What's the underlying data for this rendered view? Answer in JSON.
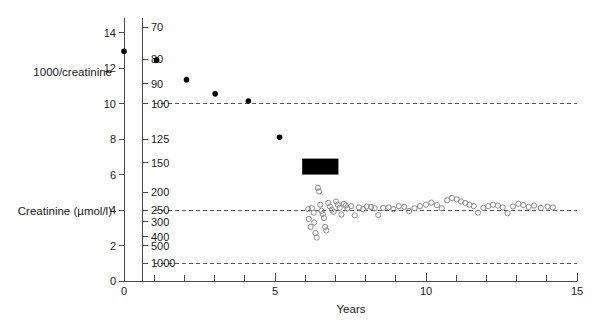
{
  "chart_data": {
    "type": "scatter",
    "title": "",
    "xlabel": "Years",
    "ylabel_primary": "1000/creatinine",
    "ylabel_secondary": "Creatinine (µmol/l)",
    "xlim": [
      0,
      15
    ],
    "ylim": [
      0,
      14.6
    ],
    "grid": false,
    "legend": "none",
    "x_ticks_major": [
      0,
      5,
      10,
      15
    ],
    "x_ticks_minor": [
      1,
      2,
      3,
      4,
      6,
      7,
      8,
      9,
      11,
      12,
      13,
      14
    ],
    "x_tick_labels": [
      "0",
      "5",
      "10",
      "15"
    ],
    "y_ticks_left": [
      0,
      2,
      4,
      6,
      8,
      10,
      12,
      14
    ],
    "y_tick_labels_left": [
      "0",
      "2",
      "4",
      "6",
      "8",
      "10",
      "12",
      "14"
    ],
    "y_ticks_right_values": [
      14.29,
      12.5,
      11.11,
      10.0,
      8.0,
      6.67,
      5.0,
      4.0,
      3.33,
      2.5,
      2.0,
      1.0
    ],
    "y_tick_labels_right": [
      "70",
      "80",
      "90",
      "100",
      "125",
      "150",
      "200",
      "250",
      "300",
      "400",
      "500",
      "1000"
    ],
    "reference_lines": [
      {
        "y": 10.0,
        "label": "100",
        "style": "dashed"
      },
      {
        "y": 4.0,
        "label": "250",
        "style": "dashed"
      },
      {
        "y": 1.0,
        "label": "1000",
        "style": "dashed"
      }
    ],
    "annotation_bar": {
      "name": "treatment-period-bar",
      "x_start": 5.9,
      "x_end": 7.1,
      "y_bottom": 6.0,
      "y_top": 6.9,
      "color": "#000000"
    },
    "series": [
      {
        "name": "pre-treatment",
        "marker": "filled-circle",
        "color": "#000000",
        "points": [
          [
            0.0,
            12.95
          ],
          [
            1.08,
            12.45
          ],
          [
            2.07,
            11.35
          ],
          [
            3.02,
            10.55
          ],
          [
            4.12,
            10.15
          ],
          [
            5.15,
            8.1
          ]
        ]
      },
      {
        "name": "post-treatment",
        "marker": "open-circle",
        "color": "#8c8c8c",
        "points": [
          [
            6.1,
            4.05
          ],
          [
            6.12,
            3.5
          ],
          [
            6.18,
            3.05
          ],
          [
            6.22,
            4.1
          ],
          [
            6.28,
            3.85
          ],
          [
            6.3,
            3.3
          ],
          [
            6.34,
            2.7
          ],
          [
            6.38,
            2.45
          ],
          [
            6.42,
            5.25
          ],
          [
            6.46,
            5.05
          ],
          [
            6.5,
            4.3
          ],
          [
            6.54,
            3.95
          ],
          [
            6.58,
            3.78
          ],
          [
            6.62,
            3.55
          ],
          [
            6.66,
            3.05
          ],
          [
            6.7,
            2.85
          ],
          [
            6.76,
            4.4
          ],
          [
            6.82,
            4.2
          ],
          [
            6.88,
            4.02
          ],
          [
            6.94,
            3.9
          ],
          [
            7.02,
            4.48
          ],
          [
            7.08,
            4.3
          ],
          [
            7.14,
            4.12
          ],
          [
            7.2,
            3.75
          ],
          [
            7.28,
            4.35
          ],
          [
            7.34,
            4.25
          ],
          [
            7.4,
            4.08
          ],
          [
            7.52,
            4.22
          ],
          [
            7.64,
            3.7
          ],
          [
            7.78,
            4.15
          ],
          [
            7.92,
            4.05
          ],
          [
            8.04,
            4.2
          ],
          [
            8.18,
            4.18
          ],
          [
            8.3,
            4.1
          ],
          [
            8.42,
            3.72
          ],
          [
            8.58,
            4.12
          ],
          [
            8.76,
            4.15
          ],
          [
            8.92,
            4.05
          ],
          [
            9.1,
            4.22
          ],
          [
            9.28,
            4.18
          ],
          [
            9.44,
            3.95
          ],
          [
            9.62,
            4.1
          ],
          [
            9.8,
            4.22
          ],
          [
            10.0,
            4.3
          ],
          [
            10.18,
            4.42
          ],
          [
            10.36,
            4.28
          ],
          [
            10.52,
            4.1
          ],
          [
            10.7,
            4.55
          ],
          [
            10.86,
            4.68
          ],
          [
            11.02,
            4.6
          ],
          [
            11.16,
            4.48
          ],
          [
            11.3,
            4.4
          ],
          [
            11.44,
            4.3
          ],
          [
            11.58,
            4.22
          ],
          [
            11.72,
            3.85
          ],
          [
            11.9,
            4.12
          ],
          [
            12.06,
            4.22
          ],
          [
            12.22,
            4.3
          ],
          [
            12.38,
            4.25
          ],
          [
            12.54,
            4.15
          ],
          [
            12.7,
            3.82
          ],
          [
            12.88,
            4.2
          ],
          [
            13.06,
            4.35
          ],
          [
            13.22,
            4.28
          ],
          [
            13.4,
            4.18
          ],
          [
            13.58,
            4.25
          ],
          [
            13.8,
            4.12
          ],
          [
            14.02,
            4.2
          ],
          [
            14.2,
            4.15
          ]
        ]
      }
    ]
  },
  "geometry": {
    "plot_left_px": 124,
    "plot_right_px": 577,
    "plot_bottom_px": 281,
    "y_top_value_px": 22
  }
}
